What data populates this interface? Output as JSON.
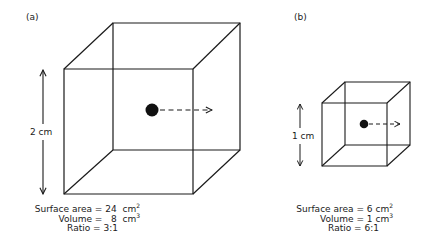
{
  "panels": [
    {
      "id": "a",
      "label": "(a)",
      "dimension_label": "2 cm",
      "side_length_cm": 2,
      "stats": {
        "surface_area_label": "Surface area",
        "surface_area_value": "24",
        "surface_area_unit": "cm",
        "surface_area_exp": "2",
        "volume_label": "Volume",
        "volume_value": "8",
        "volume_unit": "cm",
        "volume_exp": "3",
        "ratio_label": "Ratio",
        "ratio_value": "3:1"
      }
    },
    {
      "id": "b",
      "label": "(b)",
      "dimension_label": "1 cm",
      "side_length_cm": 1,
      "stats": {
        "surface_area_label": "Surface area",
        "surface_area_value": "6",
        "surface_area_unit": "cm",
        "surface_area_exp": "2",
        "volume_label": "Volume",
        "volume_value": "1",
        "volume_unit": "cm",
        "volume_exp": "3",
        "ratio_label": "Ratio",
        "ratio_value": "6:1"
      }
    }
  ],
  "symbols": {
    "equals": "="
  },
  "colors": {
    "stroke": "#1a1a1a",
    "background": "#ffffff"
  }
}
